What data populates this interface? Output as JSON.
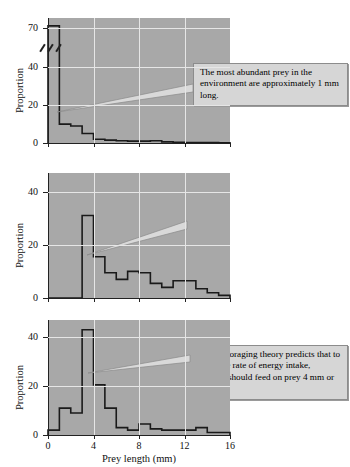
{
  "figure": {
    "xlabel": "Prey length (mm)",
    "ylabel": "Proportion"
  },
  "chart_data": [
    {
      "type": "bar",
      "title": "",
      "xlabel": "Prey length (mm)",
      "ylabel": "Proportion",
      "xticks": [
        "0",
        "4",
        "8",
        "12",
        "16"
      ],
      "xtickvalues": [
        0,
        4,
        8,
        12,
        16
      ],
      "yticks": [
        "0",
        "20",
        "40",
        "70"
      ],
      "ytickvalues": [
        0,
        20,
        40,
        70
      ],
      "xlim": [
        0,
        16
      ],
      "ylim": [
        0,
        75
      ],
      "axis_break": true,
      "axis_break_between": [
        40,
        70
      ],
      "grid": true,
      "bin_width": 1,
      "bin_starts": [
        0,
        1,
        2,
        3,
        4,
        5,
        6,
        7,
        8,
        9,
        10,
        11,
        12,
        13,
        14,
        15
      ],
      "values": [
        72,
        10,
        9,
        5,
        2,
        1.5,
        1.2,
        1.0,
        1.0,
        1.2,
        0.6,
        0.4,
        0.3,
        0.2,
        0.2,
        0.1
      ],
      "annotation": "The most abundant prey in the environment are approximately 1 mm long.",
      "annotation_points_to": [
        1.5,
        17
      ]
    },
    {
      "type": "bar",
      "title": "",
      "xlabel": "Prey length (mm)",
      "ylabel": "Proportion",
      "xticks": [
        "0",
        "4",
        "8",
        "12",
        "16"
      ],
      "xtickvalues": [
        0,
        4,
        8,
        12,
        16
      ],
      "yticks": [
        "0",
        "20",
        "40"
      ],
      "ytickvalues": [
        0,
        20,
        40
      ],
      "xlim": [
        0,
        16
      ],
      "ylim": [
        0,
        47
      ],
      "axis_break": false,
      "grid": true,
      "bin_width": 1,
      "bin_starts": [
        0,
        1,
        2,
        3,
        4,
        5,
        6,
        7,
        8,
        9,
        10,
        11,
        12,
        13,
        14,
        15
      ],
      "values": [
        0,
        0,
        0,
        31,
        15.5,
        9.5,
        7,
        10,
        9.5,
        5.5,
        4,
        6.5,
        6.5,
        3.5,
        2,
        1
      ],
      "annotation": "Optimal foraging theory predicts that to maximize rate of energy intake, bluegills should feed on prey 4 mm or longer.",
      "annotation_points_to": [
        3.4,
        19.5
      ]
    },
    {
      "type": "bar",
      "title": "",
      "xlabel": "Prey length (mm)",
      "ylabel": "Proportion",
      "xticks": [
        "0",
        "4",
        "8",
        "12",
        "16"
      ],
      "xtickvalues": [
        0,
        4,
        8,
        12,
        16
      ],
      "yticks": [
        "0",
        "20",
        "40"
      ],
      "ytickvalues": [
        0,
        20,
        40
      ],
      "xlim": [
        0,
        16
      ],
      "ylim": [
        0,
        47
      ],
      "axis_break": false,
      "grid": true,
      "bin_width": 1,
      "bin_starts": [
        0,
        1,
        2,
        3,
        4,
        5,
        6,
        7,
        8,
        9,
        10,
        11,
        12,
        13,
        14,
        15
      ],
      "values": [
        2,
        11,
        9,
        43,
        20.5,
        11,
        3,
        2,
        4.5,
        2.5,
        2,
        2,
        2,
        3,
        1,
        1
      ],
      "annotation": "As predicted the most abundant prey in bluegill diets are 4 mm in length.",
      "annotation_points_to": [
        3.6,
        25
      ]
    }
  ]
}
